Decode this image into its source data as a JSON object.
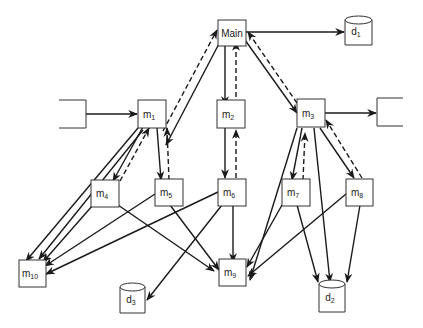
{
  "diagram": {
    "title": "",
    "modules": {
      "main": {
        "label": "Main",
        "sub": ""
      },
      "m1": {
        "label": "m",
        "sub": "1"
      },
      "m2": {
        "label": "m",
        "sub": "2"
      },
      "m3": {
        "label": "m",
        "sub": "3"
      },
      "m4": {
        "label": "m",
        "sub": "4"
      },
      "m5": {
        "label": "m",
        "sub": "5"
      },
      "m6": {
        "label": "m",
        "sub": "6"
      },
      "m7": {
        "label": "m",
        "sub": "7"
      },
      "m8": {
        "label": "m",
        "sub": "8"
      },
      "m9": {
        "label": "m",
        "sub": "9"
      },
      "m10": {
        "label": "m",
        "sub": "10"
      }
    },
    "datastores": {
      "d1": {
        "label": "d",
        "sub": "1"
      },
      "d2": {
        "label": "d",
        "sub": "2"
      },
      "d3": {
        "label": "d",
        "sub": "3"
      }
    },
    "external": {
      "left": {
        "label": ""
      },
      "right": {
        "label": ""
      }
    },
    "edges": [
      {
        "from": "main",
        "to": "m1",
        "style": "solid"
      },
      {
        "from": "m1",
        "to": "main",
        "style": "dashed"
      },
      {
        "from": "main",
        "to": "m2",
        "style": "solid"
      },
      {
        "from": "m2",
        "to": "main",
        "style": "dashed"
      },
      {
        "from": "main",
        "to": "m3",
        "style": "solid"
      },
      {
        "from": "m3",
        "to": "main",
        "style": "dashed"
      },
      {
        "from": "main",
        "to": "d1",
        "style": "solid"
      },
      {
        "from": "external-left",
        "to": "m1",
        "style": "solid"
      },
      {
        "from": "m3",
        "to": "external-right",
        "style": "solid"
      },
      {
        "from": "m1",
        "to": "m4",
        "style": "solid"
      },
      {
        "from": "m4",
        "to": "m1",
        "style": "dashed"
      },
      {
        "from": "m1",
        "to": "m5",
        "style": "solid"
      },
      {
        "from": "m5",
        "to": "m1",
        "style": "dashed"
      },
      {
        "from": "m1",
        "to": "m10",
        "style": "solid"
      },
      {
        "from": "m2",
        "to": "m6",
        "style": "solid"
      },
      {
        "from": "m6",
        "to": "m2",
        "style": "dashed"
      },
      {
        "from": "m3",
        "to": "m7",
        "style": "solid"
      },
      {
        "from": "m7",
        "to": "m3",
        "style": "dashed"
      },
      {
        "from": "m3",
        "to": "m8",
        "style": "solid"
      },
      {
        "from": "m8",
        "to": "m3",
        "style": "dashed"
      },
      {
        "from": "m3",
        "to": "m9",
        "style": "solid"
      },
      {
        "from": "m3",
        "to": "d2",
        "style": "solid"
      },
      {
        "from": "m4",
        "to": "m10",
        "style": "solid"
      },
      {
        "from": "m4",
        "to": "m9",
        "style": "solid"
      },
      {
        "from": "m5",
        "to": "m10",
        "style": "solid"
      },
      {
        "from": "m5",
        "to": "m9",
        "style": "solid"
      },
      {
        "from": "m6",
        "to": "m10",
        "style": "solid"
      },
      {
        "from": "m6",
        "to": "m9",
        "style": "solid"
      },
      {
        "from": "m6",
        "to": "d3",
        "style": "solid"
      },
      {
        "from": "m7",
        "to": "m9",
        "style": "solid"
      },
      {
        "from": "m7",
        "to": "d2",
        "style": "solid"
      },
      {
        "from": "m8",
        "to": "m9",
        "style": "solid"
      },
      {
        "from": "m8",
        "to": "d2",
        "style": "solid"
      }
    ]
  }
}
